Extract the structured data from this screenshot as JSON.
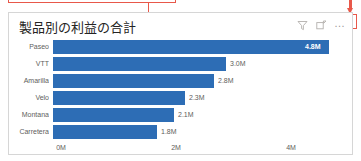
{
  "annotation": {
    "callout_box_label": "annotation-rectangle",
    "leader_label": "annotation-leader-line",
    "arrow_label": "annotation-arrow",
    "highlight_label": "more-options-highlight",
    "color": "#e8584a"
  },
  "visual": {
    "title": "製品別の利益の合計",
    "header_icons": [
      {
        "name": "filter-icon",
        "glyph": "filter"
      },
      {
        "name": "focus-mode-icon",
        "glyph": "focus"
      },
      {
        "name": "more-options-icon",
        "glyph": "…"
      }
    ]
  },
  "chart_data": {
    "type": "bar",
    "orientation": "horizontal",
    "title": "製品別の利益の合計",
    "xlabel": "",
    "ylabel": "",
    "categories": [
      "Paseo",
      "VTT",
      "Amarilla",
      "Velo",
      "Montana",
      "Carretera"
    ],
    "values": [
      4800000,
      3000000,
      2800000,
      2300000,
      2100000,
      1800000
    ],
    "labels": [
      "4.8M",
      "3.0M",
      "2.8M",
      "2.3M",
      "2.1M",
      "1.8M"
    ],
    "label_positions": [
      "inside",
      "outside",
      "outside",
      "outside",
      "outside",
      "outside"
    ],
    "xlim": [
      0,
      5000000
    ],
    "xticks": [
      0,
      2000000,
      4000000
    ],
    "xtick_labels": [
      "0M",
      "2M",
      "4M"
    ],
    "grid": false,
    "legend": "none",
    "series_color": "#2d6db5"
  }
}
